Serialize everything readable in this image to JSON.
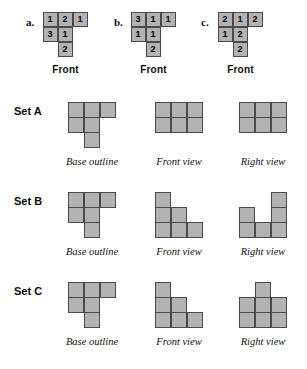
{
  "top_section": {
    "puzzles": [
      {
        "letter": "a.",
        "front_label": "Front",
        "rows": [
          [
            "1",
            "2",
            "1"
          ],
          [
            "3",
            "1",
            ""
          ],
          [
            "",
            "2",
            ""
          ]
        ]
      },
      {
        "letter": "b.",
        "front_label": "Front",
        "rows": [
          [
            "3",
            "1",
            "1"
          ],
          [
            "1",
            "1",
            ""
          ],
          [
            "",
            "2",
            ""
          ]
        ]
      },
      {
        "letter": "c.",
        "front_label": "Front",
        "rows": [
          [
            "2",
            "1",
            "2"
          ],
          [
            "1",
            "2",
            ""
          ],
          [
            "",
            "2",
            ""
          ]
        ]
      }
    ]
  },
  "captions": {
    "base": "Base outline",
    "front": "Front view",
    "right": "Right view"
  },
  "sets": [
    {
      "title": "Set A",
      "base_outline": [
        [
          1,
          1,
          1
        ],
        [
          1,
          1,
          0
        ],
        [
          0,
          1,
          0
        ]
      ],
      "front_view": [
        [
          1,
          1,
          1
        ],
        [
          1,
          1,
          1
        ]
      ],
      "right_view": [
        [
          1,
          1,
          1
        ],
        [
          1,
          1,
          1
        ]
      ]
    },
    {
      "title": "Set B",
      "base_outline": [
        [
          1,
          1,
          1
        ],
        [
          1,
          1,
          0
        ],
        [
          0,
          1,
          0
        ]
      ],
      "front_view": [
        [
          1,
          0,
          0
        ],
        [
          1,
          1,
          0
        ],
        [
          1,
          1,
          1
        ]
      ],
      "right_view": [
        [
          0,
          0,
          1
        ],
        [
          1,
          0,
          1
        ],
        [
          1,
          1,
          1
        ]
      ]
    },
    {
      "title": "Set C",
      "base_outline": [
        [
          1,
          1,
          1
        ],
        [
          1,
          1,
          0
        ],
        [
          0,
          1,
          0
        ]
      ],
      "front_view": [
        [
          1,
          0,
          0
        ],
        [
          1,
          1,
          0
        ],
        [
          1,
          1,
          1
        ]
      ],
      "right_view": [
        [
          0,
          1,
          0
        ],
        [
          1,
          1,
          1
        ],
        [
          1,
          1,
          1
        ]
      ]
    }
  ],
  "colors": {
    "cell_fill": "#b2b2b2",
    "cell_border": "#4a4a4a",
    "background": "#ffffff"
  }
}
